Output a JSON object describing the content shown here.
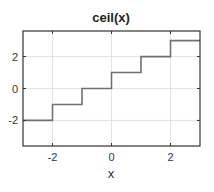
{
  "chart_data": {
    "type": "line",
    "title": "ceil(x)",
    "xlabel": "x",
    "ylabel": "",
    "xlim": [
      -3,
      3
    ],
    "ylim": [
      -3.6,
      3.6
    ],
    "xticks": [
      -2,
      0,
      2
    ],
    "yticks": [
      -2,
      0,
      2
    ],
    "grid": true,
    "legend": null,
    "series": [
      {
        "name": "ceil(x)",
        "color": "#707070",
        "step": true,
        "x": [
          -3,
          -2,
          -2,
          -1,
          -1,
          0,
          0,
          1,
          1,
          2,
          2,
          3
        ],
        "y": [
          -2,
          -2,
          -1,
          -1,
          0,
          0,
          1,
          1,
          2,
          2,
          3,
          3
        ]
      }
    ]
  }
}
